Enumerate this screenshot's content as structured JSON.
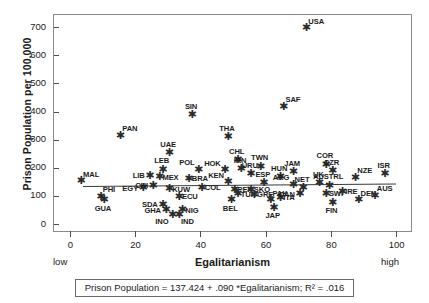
{
  "chart_data": {
    "type": "scatter",
    "title": "",
    "xlabel": "Egalitarianism",
    "ylabel": "Prison Population per 100,000",
    "xlim": [
      -5,
      105
    ],
    "ylim": [
      -30,
      745
    ],
    "xticks": [
      0,
      20,
      40,
      60,
      80,
      100
    ],
    "yticks": [
      0,
      100,
      200,
      300,
      400,
      500,
      600,
      700
    ],
    "x_axis_low_label": "low",
    "x_axis_high_label": "high",
    "grid": false,
    "legend": null,
    "regression": {
      "intercept": 137.424,
      "slope": 0.09,
      "r_squared": 0.016,
      "caption": "Prison Population = 137.424 + .090 *Egalitarianism; R² = .016",
      "x_start": 4,
      "x_end": 100
    },
    "points": [
      {
        "label": "MAL",
        "x": 3,
        "y": 155,
        "pos": "ne"
      },
      {
        "label": "PHI",
        "x": 9,
        "y": 100,
        "pos": "ne"
      },
      {
        "label": "GUA",
        "x": 10,
        "y": 88,
        "pos": "s"
      },
      {
        "label": "PAN",
        "x": 15,
        "y": 318,
        "pos": "ne"
      },
      {
        "label": "EGY",
        "x": 22,
        "y": 131,
        "pos": "w"
      },
      {
        "label": "LIB",
        "x": 24,
        "y": 175,
        "pos": "w"
      },
      {
        "label": "CHI",
        "x": 25,
        "y": 140,
        "pos": "w"
      },
      {
        "label": "SDA",
        "x": 28,
        "y": 72,
        "pos": "w"
      },
      {
        "label": "GHA",
        "x": 29,
        "y": 52,
        "pos": "w"
      },
      {
        "label": "INO",
        "x": 31,
        "y": 35,
        "pos": "sw"
      },
      {
        "label": "IND",
        "x": 33,
        "y": 35,
        "pos": "se"
      },
      {
        "label": "NIG",
        "x": 34,
        "y": 52,
        "pos": "e"
      },
      {
        "label": "MEX",
        "x": 27,
        "y": 170,
        "pos": "e"
      },
      {
        "label": "LEB",
        "x": 28,
        "y": 196,
        "pos": "n"
      },
      {
        "label": "KUW",
        "x": 30,
        "y": 128,
        "pos": "e"
      },
      {
        "label": "ECU",
        "x": 33,
        "y": 100,
        "pos": "e"
      },
      {
        "label": "UAE",
        "x": 30,
        "y": 255,
        "pos": "n"
      },
      {
        "label": "SIN",
        "x": 37,
        "y": 390,
        "pos": "n"
      },
      {
        "label": "BRA",
        "x": 36,
        "y": 165,
        "pos": "e"
      },
      {
        "label": "COL",
        "x": 40,
        "y": 133,
        "pos": "e"
      },
      {
        "label": "POL",
        "x": 39,
        "y": 196,
        "pos": "nw"
      },
      {
        "label": "THA",
        "x": 48,
        "y": 313,
        "pos": "n"
      },
      {
        "label": "CHL",
        "x": 51,
        "y": 230,
        "pos": "n"
      },
      {
        "label": "HOK",
        "x": 47,
        "y": 195,
        "pos": "nw"
      },
      {
        "label": "IRN",
        "x": 52,
        "y": 198,
        "pos": "n"
      },
      {
        "label": "KEN",
        "x": 48,
        "y": 152,
        "pos": "nw"
      },
      {
        "label": "PER",
        "x": 50,
        "y": 125,
        "pos": "e"
      },
      {
        "label": "TUR",
        "x": 51,
        "y": 110,
        "pos": "e"
      },
      {
        "label": "BEL",
        "x": 49,
        "y": 88,
        "pos": "s"
      },
      {
        "label": "URU",
        "x": 55,
        "y": 180,
        "pos": "n"
      },
      {
        "label": "TWN",
        "x": 58,
        "y": 208,
        "pos": "n"
      },
      {
        "label": "SKO",
        "x": 55,
        "y": 125,
        "pos": "e"
      },
      {
        "label": "GRE",
        "x": 56,
        "y": 108,
        "pos": "e"
      },
      {
        "label": "ESP",
        "x": 59,
        "y": 148,
        "pos": "n"
      },
      {
        "label": "PAK",
        "x": 61,
        "y": 88,
        "pos": "ne"
      },
      {
        "label": "JAP",
        "x": 62,
        "y": 62,
        "pos": "s"
      },
      {
        "label": "ITA",
        "x": 64,
        "y": 97,
        "pos": "e"
      },
      {
        "label": "SAF",
        "x": 65,
        "y": 420,
        "pos": "ne"
      },
      {
        "label": "HUN",
        "x": 64,
        "y": 170,
        "pos": "n"
      },
      {
        "label": "JAM",
        "x": 68,
        "y": 188,
        "pos": "n"
      },
      {
        "label": "ARG",
        "x": 68,
        "y": 143,
        "pos": "nw"
      },
      {
        "label": "NET",
        "x": 71,
        "y": 130,
        "pos": "n"
      },
      {
        "label": "CAN",
        "x": 70,
        "y": 110,
        "pos": "w"
      },
      {
        "label": "USA",
        "x": 72,
        "y": 700,
        "pos": "ne"
      },
      {
        "label": "COR",
        "x": 78,
        "y": 215,
        "pos": "n"
      },
      {
        "label": "CZR",
        "x": 80,
        "y": 192,
        "pos": "n"
      },
      {
        "label": "UK",
        "x": 76,
        "y": 148,
        "pos": "n"
      },
      {
        "label": "AUSTRL",
        "x": 79,
        "y": 140,
        "pos": "n"
      },
      {
        "label": "SWI",
        "x": 78,
        "y": 112,
        "pos": "e"
      },
      {
        "label": "IRE",
        "x": 83,
        "y": 118,
        "pos": "e"
      },
      {
        "label": "FIN",
        "x": 80,
        "y": 80,
        "pos": "s"
      },
      {
        "label": "NZE",
        "x": 87,
        "y": 168,
        "pos": "ne"
      },
      {
        "label": "DEN",
        "x": 88,
        "y": 88,
        "pos": "ne"
      },
      {
        "label": "AUS",
        "x": 93,
        "y": 105,
        "pos": "ne"
      },
      {
        "label": "ISR",
        "x": 96,
        "y": 180,
        "pos": "n"
      }
    ]
  }
}
